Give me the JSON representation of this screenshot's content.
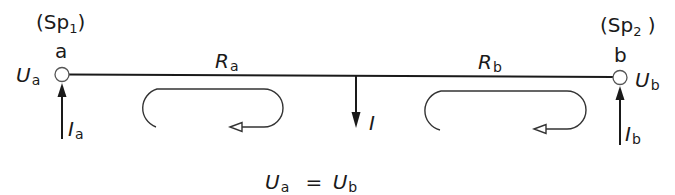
{
  "diagram": {
    "nodes": {
      "a": {
        "name": "a",
        "group_label": "(Sp",
        "group_index": "1",
        "group_close": ")",
        "voltage_symbol": "U",
        "voltage_sub": "a",
        "current_symbol": "I",
        "current_sub": "a"
      },
      "b": {
        "name": "b",
        "group_label": "(Sp",
        "group_index": "2",
        "group_close": " )",
        "voltage_symbol": "U",
        "voltage_sub": "b",
        "current_symbol": "I",
        "current_sub": "b"
      }
    },
    "resistors": {
      "a": {
        "symbol": "R",
        "sub": "a"
      },
      "b": {
        "symbol": "R",
        "sub": "b"
      }
    },
    "load_current": {
      "symbol": "I"
    },
    "equation": {
      "lhs_symbol": "U",
      "lhs_sub": "a",
      "operator": "=",
      "rhs_symbol": "U",
      "rhs_sub": "b"
    },
    "colors": {
      "stroke": "#1a1a1a",
      "background": "#ffffff"
    }
  }
}
